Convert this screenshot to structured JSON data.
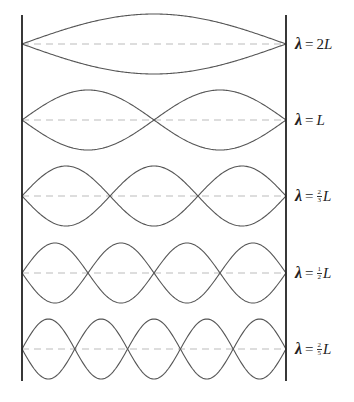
{
  "geometry": {
    "left_wall_x": 22,
    "right_wall_x": 286,
    "wall_top_y": 15,
    "wall_bottom_y": 381,
    "amplitude": 30
  },
  "colors": {
    "wall": "#222222",
    "wave": "#555555",
    "axis_dashed": "#bbbbbb",
    "label": "#222222"
  },
  "modes": [
    {
      "harmonic": 1,
      "loops": 1,
      "axis_y": 44,
      "label": {
        "lambda": "λ",
        "equals": "=",
        "coef_whole": "2",
        "coef_num": "",
        "coef_den": "",
        "unit": "L"
      }
    },
    {
      "harmonic": 2,
      "loops": 2,
      "axis_y": 120,
      "label": {
        "lambda": "λ",
        "equals": "=",
        "coef_whole": "",
        "coef_num": "",
        "coef_den": "",
        "unit": "L"
      }
    },
    {
      "harmonic": 3,
      "loops": 3,
      "axis_y": 196,
      "label": {
        "lambda": "λ",
        "equals": "=",
        "coef_whole": "",
        "coef_num": "2",
        "coef_den": "3",
        "unit": "L"
      }
    },
    {
      "harmonic": 4,
      "loops": 4,
      "axis_y": 273,
      "label": {
        "lambda": "λ",
        "equals": "=",
        "coef_whole": "",
        "coef_num": "1",
        "coef_den": "2",
        "unit": "L"
      }
    },
    {
      "harmonic": 5,
      "loops": 5,
      "axis_y": 349,
      "label": {
        "lambda": "λ",
        "equals": "=",
        "coef_whole": "",
        "coef_num": "2",
        "coef_den": "5",
        "unit": "L"
      }
    }
  ]
}
